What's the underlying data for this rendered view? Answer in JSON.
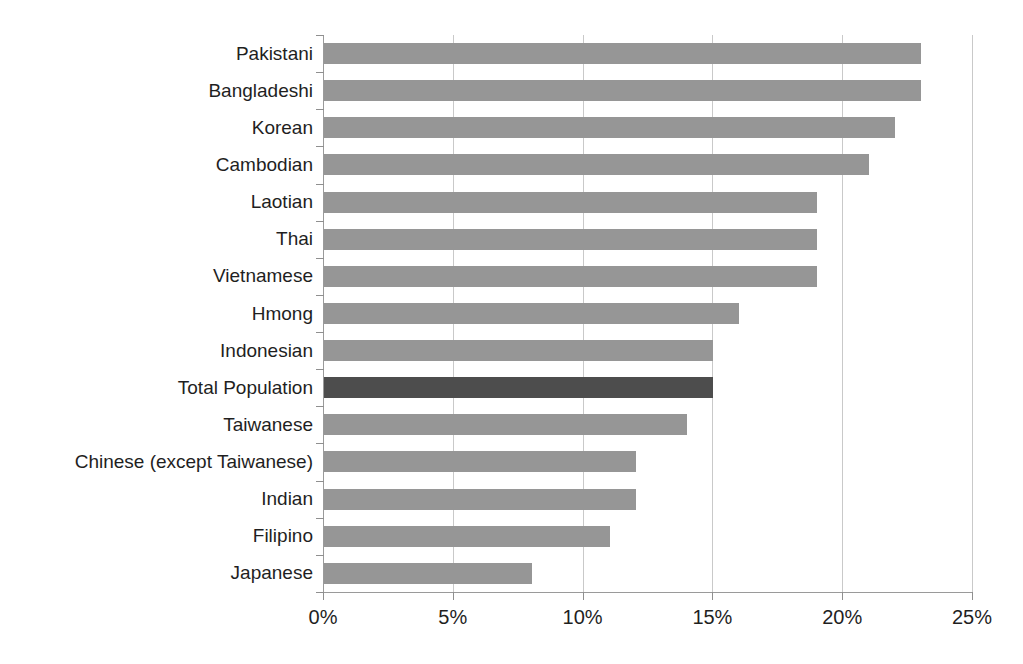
{
  "chart_data": {
    "type": "bar",
    "orientation": "horizontal",
    "title": "Percent Uninsured in the United States",
    "xlabel": "",
    "ylabel": "",
    "xlim": [
      0,
      25
    ],
    "xticks": [
      0,
      5,
      10,
      15,
      20,
      25
    ],
    "xtick_labels": [
      "0%",
      "5%",
      "10%",
      "15%",
      "20%",
      "25%"
    ],
    "grid": "vertical",
    "legend": "none",
    "value_unit": "percent",
    "categories": [
      "Pakistani",
      "Bangladeshi",
      "Korean",
      "Cambodian",
      "Laotian",
      "Thai",
      "Vietnamese",
      "Hmong",
      "Indonesian",
      "Total Population",
      "Taiwanese",
      "Chinese (except Taiwanese)",
      "Indian",
      "Filipino",
      "Japanese"
    ],
    "values": [
      23,
      23,
      22,
      21,
      19,
      19,
      19,
      16,
      15,
      15,
      14,
      12,
      12,
      11,
      8
    ],
    "highlight_category": "Total Population",
    "colors": {
      "bar": "#969696",
      "bar_highlight": "#4d4d4d",
      "gridline": "#c9c9c9",
      "axis": "#9a9a9a",
      "text": "#1f1f1f"
    }
  }
}
